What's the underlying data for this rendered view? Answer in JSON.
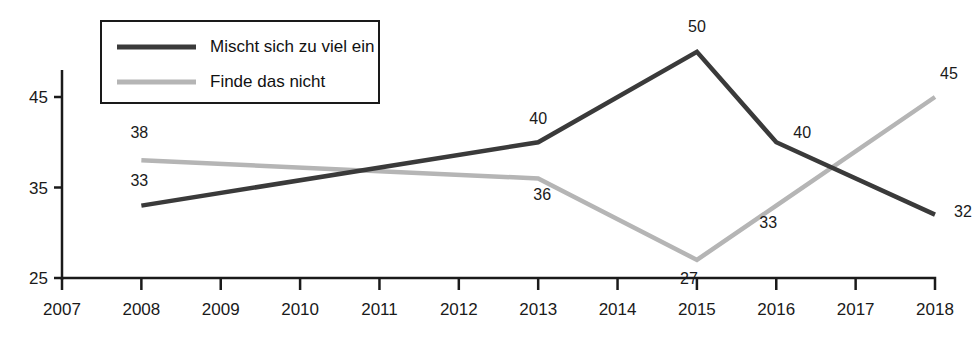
{
  "chart_data": {
    "type": "line",
    "title": "",
    "xlabel": "",
    "ylabel": "",
    "x": [
      2007,
      2008,
      2009,
      2010,
      2011,
      2012,
      2013,
      2014,
      2015,
      2016,
      2017,
      2018
    ],
    "xtick_labels": [
      "2007",
      "2008",
      "2009",
      "2010",
      "2011",
      "2012",
      "2013",
      "2014",
      "2015",
      "2016",
      "2017",
      "2018"
    ],
    "ytick_labels": [
      "25",
      "35",
      "45"
    ],
    "yticks": [
      25,
      35,
      45
    ],
    "ylim": [
      23.5,
      53
    ],
    "xlim": [
      2007,
      2018
    ],
    "grid": false,
    "legend_position": "top-left",
    "series": [
      {
        "name": "Mischt sich zu viel ein",
        "color": "#3a3a3a",
        "x": [
          2008,
          2013,
          2015,
          2016,
          2018
        ],
        "values": [
          33,
          40,
          50,
          40,
          32
        ],
        "labels": [
          "33",
          "40",
          "50",
          "40",
          "32"
        ]
      },
      {
        "name": "Finde das nicht",
        "color": "#b5b5b5",
        "x": [
          2008,
          2013,
          2015,
          2016,
          2018
        ],
        "values": [
          38,
          36,
          27,
          33,
          45
        ],
        "labels": [
          "38",
          "36",
          "27",
          "33",
          "45"
        ]
      }
    ]
  },
  "legend": {
    "items": [
      {
        "label": "Mischt sich zu viel ein",
        "color": "#3a3a3a"
      },
      {
        "label": "Finde das nicht",
        "color": "#b5b5b5"
      }
    ]
  },
  "axes": {
    "y_labels": [
      "45",
      "35",
      "25"
    ],
    "x_labels": [
      "2007",
      "2008",
      "2009",
      "2010",
      "2011",
      "2012",
      "2013",
      "2014",
      "2015",
      "2016",
      "2017",
      "2018"
    ]
  },
  "point_labels": {
    "dark": [
      "33",
      "40",
      "50",
      "40",
      "32"
    ],
    "light": [
      "38",
      "36",
      "27",
      "33",
      "45"
    ]
  },
  "colors": {
    "dark_series": "#3a3a3a",
    "light_series": "#b5b5b5",
    "axis": "#1a1a1a",
    "background": "#ffffff"
  }
}
